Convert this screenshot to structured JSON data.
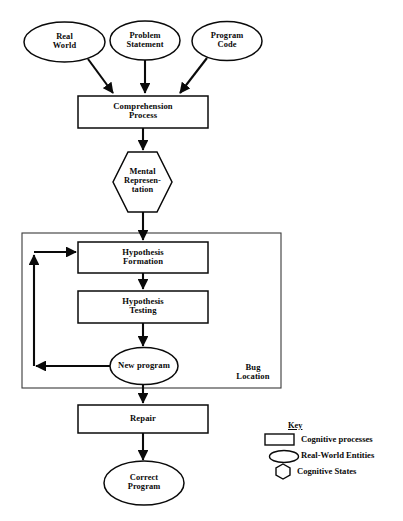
{
  "diagram": {
    "nodes": {
      "real_world": {
        "label": "Real\nWorld",
        "shape": "ellipse"
      },
      "problem_statement": {
        "label": "Problem\nStatement",
        "shape": "ellipse"
      },
      "program_code": {
        "label": "Program\nCode",
        "shape": "ellipse"
      },
      "comprehension_process": {
        "label": "Comprehension\nProcess",
        "shape": "rectangle"
      },
      "mental_representation": {
        "label": "Mental\nRepresen-\ntation",
        "shape": "hexagon"
      },
      "hypothesis_formation": {
        "label": "Hypothesis\nFormation",
        "shape": "rectangle"
      },
      "hypothesis_testing": {
        "label": "Hypothesis\nTesting",
        "shape": "rectangle"
      },
      "new_program": {
        "label": "New program",
        "shape": "ellipse"
      },
      "repair": {
        "label": "Repair",
        "shape": "rectangle"
      },
      "correct_program": {
        "label": "Correct\nProgram",
        "shape": "ellipse"
      }
    },
    "groups": {
      "bug_location": {
        "label": "Bug\nLocation",
        "shape": "rectangle"
      }
    }
  },
  "legend": {
    "title": "Key",
    "items": [
      {
        "shape": "rectangle",
        "label": "Cognitive processes"
      },
      {
        "shape": "ellipse",
        "label": "Real-World Entities"
      },
      {
        "shape": "hexagon",
        "label": "Cognitive States"
      }
    ]
  },
  "colors": {
    "stroke": "#0a0a0a",
    "fill": "#ffffff",
    "group_stroke": "#3a3a3a",
    "text": "#0a0a0a"
  }
}
